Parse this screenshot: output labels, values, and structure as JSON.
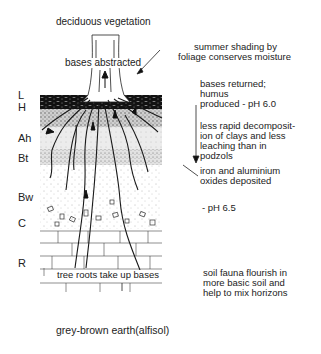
{
  "title": "grey-brown earth(alfisol)",
  "top_label": "deciduous vegetation",
  "horizons": [
    {
      "code": "L",
      "y": 93
    },
    {
      "code": "H",
      "y": 105
    },
    {
      "code": "Ah",
      "y": 137
    },
    {
      "code": "Bt",
      "y": 156
    },
    {
      "code": "Bw",
      "y": 194
    },
    {
      "code": "C",
      "y": 219
    },
    {
      "code": "R",
      "y": 261
    }
  ],
  "annotations": {
    "bases_abstracted": "bases abstracted",
    "summer_shading": [
      "summer shading by",
      "foliage conserves moisture"
    ],
    "bases_returned": [
      "bases returned;",
      "humus",
      "produced - pH 6.0"
    ],
    "less_rapid": [
      "less rapid decomposit-",
      "ion of clays and less",
      "leaching than in",
      "podzols"
    ],
    "iron_aluminium": [
      "iron and aluminium",
      "oxides deposited"
    ],
    "ph_65": "- pH 6.5",
    "tree_roots": "tree roots take up bases",
    "soil_fauna": [
      "soil fauna flourish in",
      "more basic soil and",
      "help to mix horizons"
    ]
  },
  "colors": {
    "ink": "#1a1a1a",
    "background": "#ffffff",
    "humus": "#111111",
    "stipple": "#8a8a8a"
  }
}
